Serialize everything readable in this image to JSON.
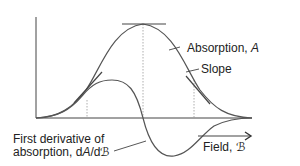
{
  "diagram": {
    "curves": {
      "absorption": {
        "label_prefix": "Absorption, ",
        "label_var": "A"
      },
      "slope": {
        "label": "Slope"
      },
      "derivative": {
        "label_line1": "First derivative of",
        "label_line2_prefix": "absorption, d",
        "label_line2_var": "A",
        "label_line2_mid": "/d",
        "label_line2_sym": "ℬ"
      }
    },
    "axis": {
      "x_label_prefix": "Field, ",
      "x_label_sym": "ℬ"
    },
    "colors": {
      "curve": "#555555",
      "axis": "#444444",
      "text": "#222222",
      "dotted": "#999999"
    }
  }
}
